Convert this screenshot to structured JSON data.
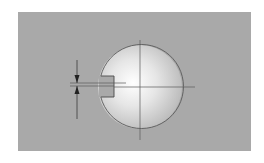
{
  "diagram": {
    "title": "",
    "colors": {
      "background": "#ffffff",
      "panel": "#a9a9a9",
      "sphere_highlight": "#ffffff",
      "sphere_edge": "#bdbdbd",
      "line": "#5a5a5a",
      "arrow": "#2a2a2a"
    },
    "sphere": {
      "cx": 140,
      "cy": 87,
      "r": 42
    },
    "slot": {
      "left_x": 100,
      "right_x": 114,
      "top_y": 76,
      "bottom_y": 97
    },
    "centerlines": {
      "vertical": {
        "x": 140,
        "y1": 40,
        "y2": 140
      },
      "horizontal": {
        "y": 87,
        "x1": 70,
        "x2": 195
      }
    },
    "dimension": {
      "x": 77,
      "y1": 60,
      "y2": 119,
      "upper_ext_y": 83,
      "lower_ext_y": 86,
      "labels": []
    }
  }
}
